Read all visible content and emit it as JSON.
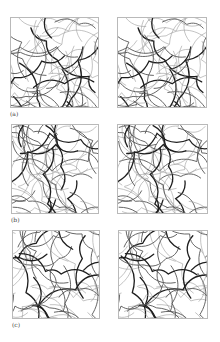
{
  "figure": {
    "rows": [
      {
        "label": "(a)",
        "panels": [
          {
            "name": "network-a-left",
            "seed": 11
          },
          {
            "name": "network-a-right",
            "seed": 11
          }
        ]
      },
      {
        "label": "(b)",
        "panels": [
          {
            "name": "network-b-left",
            "seed": 23
          },
          {
            "name": "network-b-right",
            "seed": 23
          }
        ]
      },
      {
        "label": "(c)",
        "panels": [
          {
            "name": "network-c-left",
            "seed": 37
          },
          {
            "name": "network-c-right",
            "seed": 37
          }
        ]
      }
    ],
    "colors": {
      "background": "#ffffff",
      "frame": "#b9b9b9",
      "fiber_dark": "#1e1e1e",
      "fiber_mid": "#555555",
      "fiber_light": "#9a9a9a",
      "label": "#444444"
    }
  }
}
